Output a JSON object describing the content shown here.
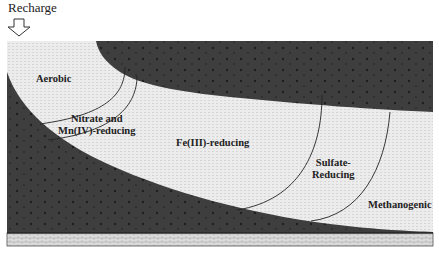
{
  "recharge": {
    "label": "Recharge",
    "icon": "down-arrow-icon"
  },
  "zones": [
    {
      "label": "Aerobic"
    },
    {
      "label": "Nitrate and\nMn(IV)-reducing",
      "line1": "Nitrate and",
      "line2": "Mn(IV)-reducing"
    },
    {
      "label": "Fe(III)-reducing"
    },
    {
      "label": "Sulfate-\nReducing",
      "line1": "Sulfate-",
      "line2": "Reducing"
    },
    {
      "label": "Methanogenic"
    }
  ],
  "colors": {
    "aquifer_light": "#e9e9e9",
    "confining_dark": "#3f3f3f",
    "bedrock": "#cfcfcf",
    "line": "#222222"
  }
}
